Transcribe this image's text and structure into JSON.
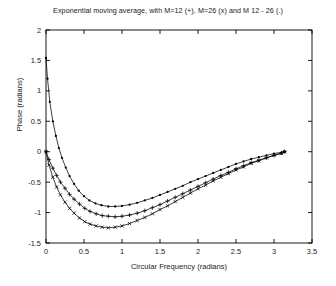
{
  "chart_data": {
    "type": "line",
    "title": "Exponential moving average, with M=12 (+), M=26 (x) and M 12 - 26 (.)",
    "xlabel": "Circular Frequency  (radians)",
    "ylabel": "Phase (radians)",
    "xlim": [
      0,
      3.5
    ],
    "ylim": [
      -1.5,
      2
    ],
    "xticks": [
      "0",
      "0.5",
      "1",
      "1.5",
      "2",
      "2.5",
      "3",
      "3.5"
    ],
    "xtick_values": [
      0,
      0.5,
      1,
      1.5,
      2,
      2.5,
      3,
      3.5
    ],
    "yticks": [
      "2",
      "1.5",
      "1",
      "0.5",
      "0",
      "-0.5",
      "-1",
      "-1.5"
    ],
    "ytick_values": [
      2,
      1.5,
      1,
      0.5,
      0,
      -0.5,
      -1,
      -1.5
    ],
    "grid": false,
    "legend_position": "in-title",
    "series": [
      {
        "name": "M 12 - 26 (.)",
        "marker": "dot",
        "x": [
          0.0,
          0.02,
          0.05,
          0.09,
          0.13,
          0.17,
          0.21,
          0.26,
          0.31,
          0.37,
          0.43,
          0.5,
          0.57,
          0.65,
          0.73,
          0.82,
          0.91,
          1.0,
          1.1,
          1.2,
          1.3,
          1.4,
          1.5,
          1.6,
          1.7,
          1.8,
          1.9,
          2.0,
          2.1,
          2.2,
          2.3,
          2.4,
          2.5,
          2.6,
          2.7,
          2.8,
          2.9,
          3.0,
          3.1,
          3.14
        ],
        "y": [
          1.54,
          1.2,
          0.82,
          0.5,
          0.26,
          0.06,
          -0.1,
          -0.26,
          -0.4,
          -0.53,
          -0.64,
          -0.73,
          -0.8,
          -0.85,
          -0.88,
          -0.9,
          -0.9,
          -0.89,
          -0.87,
          -0.84,
          -0.8,
          -0.76,
          -0.71,
          -0.66,
          -0.61,
          -0.56,
          -0.5,
          -0.45,
          -0.4,
          -0.35,
          -0.3,
          -0.25,
          -0.2,
          -0.16,
          -0.12,
          -0.09,
          -0.06,
          -0.03,
          -0.01,
          0.0
        ]
      },
      {
        "name": "M=12 (+)",
        "marker": "plus",
        "x": [
          0.0,
          0.04,
          0.09,
          0.14,
          0.19,
          0.25,
          0.31,
          0.37,
          0.44,
          0.51,
          0.58,
          0.66,
          0.74,
          0.82,
          0.91,
          1.0,
          1.1,
          1.2,
          1.3,
          1.4,
          1.5,
          1.6,
          1.7,
          1.8,
          1.9,
          2.0,
          2.1,
          2.2,
          2.3,
          2.4,
          2.5,
          2.6,
          2.7,
          2.8,
          2.9,
          3.0,
          3.1,
          3.14
        ],
        "y": [
          0.0,
          -0.13,
          -0.27,
          -0.39,
          -0.5,
          -0.6,
          -0.7,
          -0.78,
          -0.86,
          -0.93,
          -0.98,
          -1.02,
          -1.05,
          -1.06,
          -1.07,
          -1.06,
          -1.04,
          -1.01,
          -0.97,
          -0.92,
          -0.87,
          -0.81,
          -0.75,
          -0.69,
          -0.63,
          -0.57,
          -0.51,
          -0.45,
          -0.39,
          -0.34,
          -0.28,
          -0.23,
          -0.18,
          -0.14,
          -0.1,
          -0.06,
          -0.02,
          0.0
        ]
      },
      {
        "name": "M=26 (x)",
        "marker": "x",
        "x": [
          0.0,
          0.04,
          0.09,
          0.14,
          0.19,
          0.25,
          0.31,
          0.37,
          0.44,
          0.51,
          0.58,
          0.66,
          0.74,
          0.82,
          0.91,
          1.0,
          1.1,
          1.2,
          1.3,
          1.4,
          1.5,
          1.6,
          1.7,
          1.8,
          1.9,
          2.0,
          2.1,
          2.2,
          2.3,
          2.4,
          2.5,
          2.6,
          2.7,
          2.8,
          2.9,
          3.0,
          3.1,
          3.14
        ],
        "y": [
          0.0,
          -0.22,
          -0.42,
          -0.58,
          -0.71,
          -0.83,
          -0.93,
          -1.01,
          -1.09,
          -1.15,
          -1.19,
          -1.22,
          -1.24,
          -1.25,
          -1.24,
          -1.22,
          -1.18,
          -1.13,
          -1.08,
          -1.02,
          -0.95,
          -0.89,
          -0.82,
          -0.75,
          -0.68,
          -0.61,
          -0.55,
          -0.48,
          -0.42,
          -0.36,
          -0.3,
          -0.25,
          -0.19,
          -0.15,
          -0.1,
          -0.06,
          -0.03,
          0.0
        ]
      }
    ]
  }
}
